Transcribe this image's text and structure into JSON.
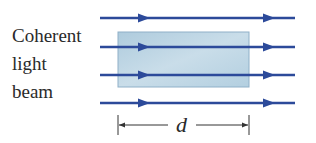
{
  "label": {
    "lines": [
      "Coherent",
      "light",
      "beam"
    ]
  },
  "dimension": {
    "symbol": "d"
  },
  "colors": {
    "beam": "#2c4a9a",
    "slab_fill": "#b9d3e3",
    "slab_border": "#8fb0c8",
    "text": "#2a2a2a",
    "dimension_line": "#333333"
  },
  "beams": {
    "count": 4,
    "y_positions": [
      18,
      47,
      75,
      103
    ],
    "x_start": 100,
    "x_end": 295,
    "arrow_positions": [
      145,
      270
    ]
  },
  "slab": {
    "x": 118,
    "y": 32,
    "width": 131,
    "height": 55
  }
}
